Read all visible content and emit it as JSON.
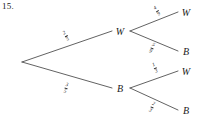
{
  "figure": {
    "exercise_number": "15.",
    "width": 203,
    "height": 125,
    "background": "#ffffff",
    "line_color": "#3a3a3a"
  },
  "diagram": {
    "type": "probability-tree",
    "root": {
      "x": 22,
      "y": 62,
      "label": ""
    },
    "level1": [
      {
        "id": "w1",
        "label": "W",
        "x": 120,
        "y": 31
      },
      {
        "id": "b1",
        "label": "B",
        "x": 120,
        "y": 88
      }
    ],
    "level2": [
      {
        "id": "w1w",
        "label": "W",
        "x": 186,
        "y": 12
      },
      {
        "id": "w1b",
        "label": "B",
        "x": 186,
        "y": 51
      },
      {
        "id": "b1w",
        "label": "W",
        "x": 186,
        "y": 71
      },
      {
        "id": "b1b",
        "label": "B",
        "x": 186,
        "y": 110
      }
    ],
    "branches": [
      {
        "id": "root-w",
        "from": "root",
        "to": "w1",
        "numerator": "2",
        "denominator": "5",
        "label_x": 66,
        "label_y": 36,
        "rotation": -29
      },
      {
        "id": "root-b",
        "from": "root",
        "to": "b1",
        "numerator": "3",
        "denominator": "5",
        "label_x": 66,
        "label_y": 88,
        "rotation": 16
      },
      {
        "id": "w-w",
        "from": "w1",
        "to": "w1w",
        "numerator": "4",
        "denominator": "9",
        "label_x": 157,
        "label_y": 11,
        "rotation": -33
      },
      {
        "id": "w-b",
        "from": "w1",
        "to": "w1b",
        "numerator": "5",
        "denominator": "9",
        "label_x": 152,
        "label_y": 48,
        "rotation": 24
      },
      {
        "id": "b-w",
        "from": "b1",
        "to": "b1w",
        "numerator": "1",
        "denominator": "3",
        "label_x": 155,
        "label_y": 68,
        "rotation": -24
      },
      {
        "id": "b-b",
        "from": "b1",
        "to": "b1b",
        "numerator": "2",
        "denominator": "3",
        "label_x": 152,
        "label_y": 107,
        "rotation": 24
      }
    ]
  }
}
